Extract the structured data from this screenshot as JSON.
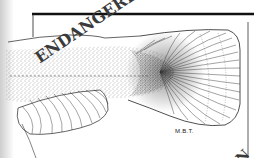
{
  "illustration": {
    "subject": "fish tail (caudal and anal fin) scientific pen-and-ink drawing",
    "stamp_text": "ENDANGERED",
    "corner_stamp_text": "EN",
    "signature": "M.B.T.",
    "colors": {
      "ink": "#1a1a1a",
      "background": "#ffffff",
      "stamp": "#3a3a3a"
    }
  }
}
